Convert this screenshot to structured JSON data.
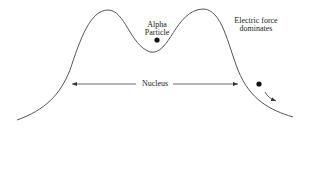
{
  "diagram": {
    "labels": {
      "alpha_particle_line1": "Alpha",
      "alpha_particle_line2": "Particle",
      "electric_force_line1": "Electric force",
      "electric_force_line2": "dominates",
      "nucleus": "Nucleus"
    },
    "colors": {
      "curve": "#555555",
      "text": "#222222",
      "dot": "#111111",
      "background": "#ffffff"
    },
    "shapes": {
      "potential_curve": "double-hump curve with a central valley",
      "alpha_particle_dot": "inside valley",
      "escaping_particle_dot": "outside right barrier",
      "nucleus_span_arrow": "double-headed horizontal arrow",
      "escape_arrow": "curved arrow pointing down-right"
    }
  }
}
